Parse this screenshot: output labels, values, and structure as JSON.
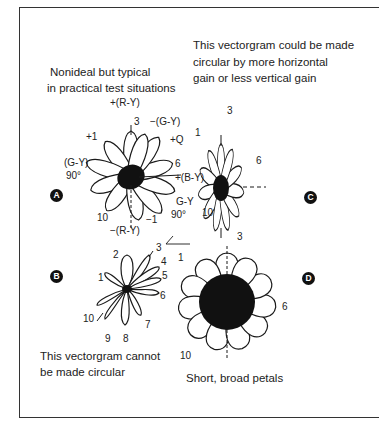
{
  "figure": {
    "panels": [
      {
        "id": "A",
        "badge": "A",
        "caption_lines": [
          "Nonideal but typical",
          "in practical test situations"
        ],
        "labels": {
          "top_axis": "+(R-Y)",
          "petal_3": "3",
          "neg_gy": "−(G-Y)",
          "plus_1": "+1",
          "plus_q": "+Q",
          "gy_left": "(G-Y)",
          "gy_left_angle": "90°",
          "petal_6": "6",
          "plus_by": "+(B-Y)",
          "gy_right": "G-Y",
          "gy_right_angle": "90°",
          "minus_1": "−1",
          "petal_10": "10",
          "bottom_axis": "−(R-Y)"
        }
      },
      {
        "id": "B",
        "badge": "B",
        "caption_lines": [
          "This vectorgram cannot",
          "be made circular"
        ],
        "labels": {
          "p1": "1",
          "p2": "2",
          "p3": "3",
          "p4": "4",
          "p5": "5",
          "p6": "6",
          "p7": "7",
          "p8": "8",
          "p9": "9",
          "p10": "10"
        }
      },
      {
        "id": "C",
        "badge": "C",
        "caption_lines": [
          "This vectorgram could be made",
          "circular by more horizontal",
          "gain or less vertical gain"
        ],
        "labels": {
          "p1": "1",
          "p3": "3",
          "p6": "6",
          "p10": "10"
        }
      },
      {
        "id": "D",
        "badge": "D",
        "caption_lines": [
          "Short, broad petals"
        ],
        "labels": {
          "p1": "1",
          "p3": "3",
          "p6": "6",
          "p10": "10"
        }
      }
    ],
    "colors": {
      "ink": "#1a1a1a",
      "background": "#ffffff",
      "frame": "#333333"
    }
  }
}
